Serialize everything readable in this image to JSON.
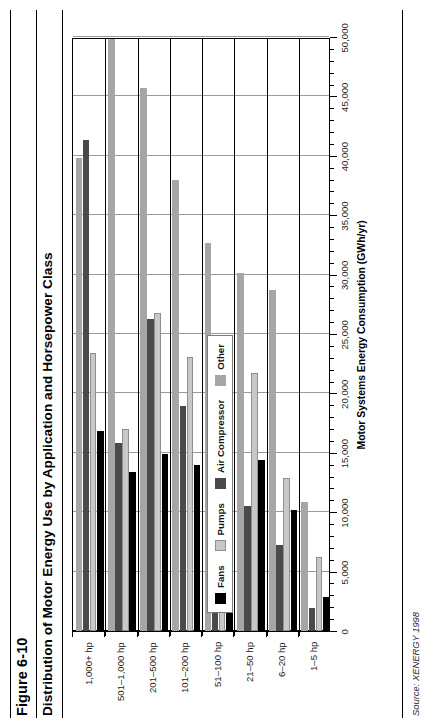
{
  "figure": {
    "number": "Figure 6-10",
    "title": "Distribution of Motor Energy Use by Application and Horsepower Class",
    "source": "Source: XENERGY 1998",
    "source_prefix": "Source:",
    "source_org": "Xenergy",
    "source_year": "1998"
  },
  "legend": {
    "position": "inside-left",
    "items": [
      {
        "label": "Fans",
        "color": "#000000",
        "key": "fans"
      },
      {
        "label": "Pumps",
        "color": "#c8c8c8",
        "key": "pumps"
      },
      {
        "label": "Air Compressor",
        "color": "#4a4a4a",
        "key": "air_compressor"
      },
      {
        "label": "Other",
        "color": "#a6a6a6",
        "key": "other"
      }
    ]
  },
  "chart_data": {
    "type": "bar",
    "orientation": "horizontal",
    "title": "Distribution of Motor Energy Use by Application and Horsepower Class",
    "xlabel": "",
    "ylabel": "Motor Systems Energy Consumption (GWh/yr)",
    "value_axis_title": "Motor Systems Energy Consumption (GWh/yr)",
    "value_axis_unit": "GWh/yr",
    "ylim": [
      0,
      50000
    ],
    "tick_interval": 5000,
    "minor_tick_interval": 1000,
    "tick_labels": [
      "0",
      "5,000",
      "10,000",
      "15,000",
      "20,000",
      "25,000",
      "30,000",
      "35,000",
      "40,000",
      "45,000",
      "50,000"
    ],
    "tick_values": [
      0,
      5000,
      10000,
      15000,
      20000,
      25000,
      30000,
      35000,
      40000,
      45000,
      50000
    ],
    "grid": true,
    "grid_axis": "value",
    "legend": true,
    "legend_position": "inside-left",
    "categories": [
      "1–5 hp",
      "6–20 hp",
      "21–50 hp",
      "51–100 hp",
      "101–200 hp",
      "201–500 hp",
      "501–1,000 hp",
      "1,000+ hp"
    ],
    "series": [
      {
        "name": "Fans",
        "color": "#000000",
        "values": [
          2900,
          10200,
          14400,
          13700,
          14000,
          14900,
          13400,
          16800
        ]
      },
      {
        "name": "Pumps",
        "color": "#c8c8c8",
        "values": [
          6200,
          12900,
          21700,
          20900,
          23100,
          26800,
          17000,
          23400
        ]
      },
      {
        "name": "Air Compressor",
        "color": "#4a4a4a",
        "values": [
          1900,
          7200,
          10500,
          11400,
          18900,
          26300,
          15800,
          41300
        ]
      },
      {
        "name": "Other",
        "color": "#a6a6a6",
        "values": [
          10900,
          28700,
          30100,
          32700,
          38000,
          45700,
          49800,
          39800
        ]
      }
    ]
  }
}
